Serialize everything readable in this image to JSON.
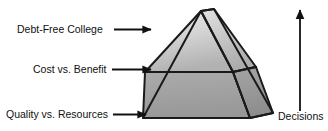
{
  "diagram": {
    "type": "pyramid-3d",
    "background_color": "#ffffff",
    "outline_color": "#1a1a1a",
    "labels": [
      {
        "id": "top",
        "text": "Debt-Free College",
        "tier": "apex",
        "arrow": "right-arrow"
      },
      {
        "id": "middle",
        "text": "Cost vs. Benefit",
        "tier": "middle",
        "arrow": "right-arrow"
      },
      {
        "id": "bottom",
        "text": "Quality vs. Resources",
        "tier": "base",
        "arrow": "right-arrow"
      }
    ],
    "axis": {
      "label": "Decisions",
      "arrow": "up-arrow",
      "direction": "upward"
    },
    "faces": [
      {
        "id": "front-upper",
        "name": "front-upper-face",
        "fill_top": "#e9e9e9",
        "fill_bottom": "#b6b6b6"
      },
      {
        "id": "front-lower",
        "name": "front-lower-face",
        "fill_top": "#aaaaaa",
        "fill_bottom": "#9a9a9a"
      },
      {
        "id": "side-upper",
        "name": "side-upper-face",
        "fill_top": "#dcdcdc",
        "fill_bottom": "#b0b0b0"
      },
      {
        "id": "side-lower",
        "name": "side-lower-face",
        "fill_top": "#a3a3a3",
        "fill_bottom": "#8f8f8f"
      }
    ]
  }
}
